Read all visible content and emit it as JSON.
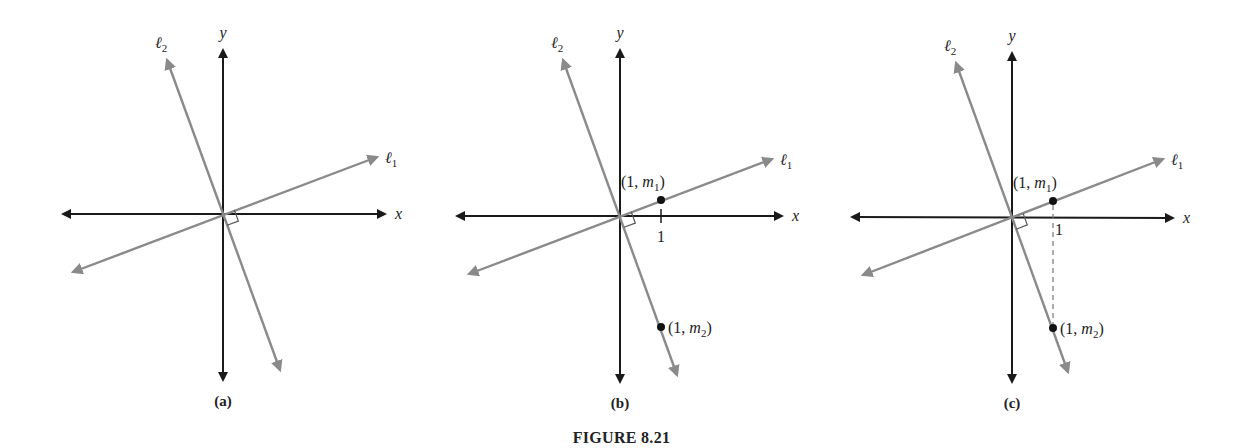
{
  "caption": "FIGURE 8.21",
  "colors": {
    "axis": "#1a1a1a",
    "line": "#8a8a8a",
    "dot": "#111111",
    "dashed": "#777777"
  },
  "labels": {
    "x_axis": "x",
    "y_axis": "y",
    "line1": "ℓ",
    "line1_sub": "1",
    "line2": "ℓ",
    "line2_sub": "2",
    "tick": "1",
    "point1_prefix": "(1, ",
    "point1_var": "m",
    "point1_sub": "1",
    "point2_prefix": "(1, ",
    "point2_var": "m",
    "point2_sub": "2",
    "point_suffix": ")"
  },
  "panels": [
    {
      "id": "a",
      "label": "(a)",
      "origin": [
        223,
        214
      ],
      "x_axis": [
        [
          63,
          214
        ],
        [
          385,
          214
        ]
      ],
      "y_axis": [
        [
          223,
          50
        ],
        [
          223,
          380
        ]
      ],
      "l1": [
        [
          73,
          272
        ],
        [
          377,
          157
        ]
      ],
      "l2": [
        [
          167,
          60
        ],
        [
          280,
          370
        ]
      ],
      "show_points": false,
      "show_dashed": false
    },
    {
      "id": "b",
      "label": "(b)",
      "origin": [
        620,
        216
      ],
      "x_axis": [
        [
          457,
          216
        ],
        [
          782,
          216
        ]
      ],
      "y_axis": [
        [
          620,
          50
        ],
        [
          620,
          382
        ]
      ],
      "l1": [
        [
          469,
          274
        ],
        [
          772,
          159
        ]
      ],
      "l2": [
        [
          563,
          60
        ],
        [
          677,
          375
        ]
      ],
      "show_points": true,
      "show_dashed": false,
      "p1": [
        661,
        200
      ],
      "p2": [
        661,
        327
      ]
    },
    {
      "id": "c",
      "label": "(c)",
      "origin": [
        1012,
        218
      ],
      "x_axis": [
        [
          852,
          217
        ],
        [
          1173,
          218
        ]
      ],
      "y_axis": [
        [
          1012,
          53
        ],
        [
          1012,
          382
        ]
      ],
      "l1": [
        [
          863,
          275
        ],
        [
          1163,
          159
        ]
      ],
      "l2": [
        [
          956,
          63
        ],
        [
          1068,
          372
        ]
      ],
      "show_points": true,
      "show_dashed": true,
      "p1": [
        1053,
        201
      ],
      "p2": [
        1053,
        328
      ]
    }
  ]
}
